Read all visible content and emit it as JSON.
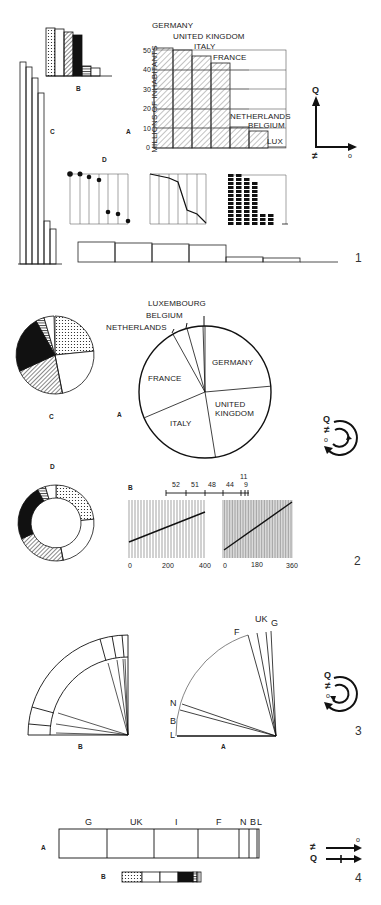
{
  "figure": {
    "panels": [
      {
        "number": "1",
        "type": "bar"
      },
      {
        "number": "2",
        "type": "pie"
      },
      {
        "number": "3",
        "type": "fan"
      },
      {
        "number": "4",
        "type": "segmented-bar"
      }
    ]
  },
  "countries": [
    {
      "name": "GERMANY",
      "abbr": "G",
      "pop": 52
    },
    {
      "name": "UNITED KINGDOM",
      "abbr": "UK",
      "pop": 51
    },
    {
      "name": "ITALY",
      "abbr": "I",
      "pop": 48
    },
    {
      "name": "FRANCE",
      "abbr": "F",
      "pop": 44
    },
    {
      "name": "NETHERLANDS",
      "abbr": "N",
      "pop": 11
    },
    {
      "name": "BELGIUM",
      "abbr": "B",
      "pop": 9
    },
    {
      "name": "LUX",
      "abbr": "L",
      "pop": 0.3
    }
  ],
  "panel1": {
    "number": "1",
    "labels": {
      "A": "A",
      "B": "B",
      "C": "C",
      "D": "D"
    },
    "ylabel": "MILLIONS OF INHABITANTS",
    "yticks": [
      "0",
      "10",
      "20",
      "30",
      "40",
      "50"
    ],
    "bar_labels": [
      "GERMANY",
      "UNITED KINGDOM",
      "ITALY",
      "FRANCE",
      "NETHERLANDS",
      "BELGIUM",
      "LUX"
    ],
    "legend": {
      "q": "Q",
      "neq": "≠",
      "o": "o"
    }
  },
  "panel2": {
    "number": "2",
    "labels": {
      "A": "A",
      "B": "B",
      "C": "C",
      "D": "D"
    },
    "pie_labels": [
      "GERMANY",
      "UNITED",
      "KINGDOM",
      "ITALY",
      "FRANCE",
      "NETHERLANDS",
      "BELGIUM",
      "LUXEMBOURG"
    ],
    "scale_ticks": [
      "52",
      "51",
      "48",
      "44",
      "11",
      "9"
    ],
    "axis1": [
      "0",
      "200",
      "400"
    ],
    "axis2": [
      "0",
      "180",
      "360"
    ],
    "legend": {
      "q": "Q",
      "neq": "≠",
      "o": "o"
    }
  },
  "panel3": {
    "number": "3",
    "labels": {
      "A": "A",
      "B": "B"
    },
    "fan_labels": [
      "G",
      "UK",
      "I",
      "F",
      "N",
      "B",
      "L"
    ],
    "legend": {
      "q": "Q",
      "neq": "≠",
      "o": "o"
    }
  },
  "panel4": {
    "number": "4",
    "labels": {
      "A": "A",
      "B": "B"
    },
    "seg_labels": [
      "G",
      "UK",
      "I",
      "F",
      "N",
      "B",
      "L"
    ],
    "legend": {
      "q": "Q",
      "neq": "≠",
      "o": "o"
    }
  },
  "chart_data": [
    {
      "type": "bar",
      "title": "Panel 1A",
      "xlabel": "",
      "ylabel": "MILLIONS OF INHABITANTS",
      "categories": [
        "GERMANY",
        "UNITED KINGDOM",
        "ITALY",
        "FRANCE",
        "NETHERLANDS",
        "BELGIUM",
        "LUX"
      ],
      "values": [
        52,
        51,
        48,
        44,
        11,
        9,
        0.3
      ],
      "ylim": [
        0,
        55
      ],
      "grid": true
    },
    {
      "type": "pie",
      "title": "Panel 2A",
      "categories": [
        "GERMANY",
        "UNITED KINGDOM",
        "ITALY",
        "FRANCE",
        "NETHERLANDS",
        "BELGIUM",
        "LUXEMBOURG"
      ],
      "values": [
        52,
        51,
        48,
        44,
        11,
        9,
        0.3
      ]
    },
    {
      "type": "line",
      "title": "Panel 2B",
      "scale_ticks": [
        52,
        51,
        48,
        44,
        11,
        9
      ],
      "axis_ranges": [
        [
          0,
          400
        ],
        [
          0,
          360
        ]
      ]
    }
  ]
}
